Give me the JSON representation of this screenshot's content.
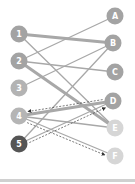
{
  "diagram": {
    "type": "bipartite-graph",
    "left_nodes": [
      {
        "id": "1",
        "label": "1",
        "x": 19,
        "y": 34,
        "color": "#a3a3a3"
      },
      {
        "id": "2",
        "label": "2",
        "x": 19,
        "y": 61,
        "color": "#a3a3a3"
      },
      {
        "id": "3",
        "label": "3",
        "x": 19,
        "y": 88,
        "color": "#b3b3b3"
      },
      {
        "id": "4",
        "label": "4",
        "x": 19,
        "y": 116,
        "color": "#b5b5b5"
      },
      {
        "id": "5",
        "label": "5",
        "x": 19,
        "y": 144,
        "color": "#555555"
      }
    ],
    "right_nodes": [
      {
        "id": "A",
        "label": "A",
        "x": 115,
        "y": 16,
        "color": "#a3a3a3"
      },
      {
        "id": "B",
        "label": "B",
        "x": 113,
        "y": 43,
        "color": "#a3a3a3"
      },
      {
        "id": "C",
        "label": "C",
        "x": 115,
        "y": 72,
        "color": "#a3a3a3"
      },
      {
        "id": "D",
        "label": "D",
        "x": 113,
        "y": 101,
        "color": "#a3a3a3"
      },
      {
        "id": "E",
        "label": "E",
        "x": 115,
        "y": 128,
        "color": "#d6d6d6"
      },
      {
        "id": "F",
        "label": "F",
        "x": 115,
        "y": 156,
        "color": "#d6d6d6"
      }
    ],
    "edges": [
      {
        "from": "1",
        "to": "B",
        "style": "thick"
      },
      {
        "from": "1",
        "to": "E",
        "style": "thin"
      },
      {
        "from": "2",
        "to": "A",
        "style": "thin"
      },
      {
        "from": "2",
        "to": "C",
        "style": "thin"
      },
      {
        "from": "2",
        "to": "E",
        "style": "thick"
      },
      {
        "from": "3",
        "to": "B",
        "style": "thin"
      },
      {
        "from": "4",
        "to": "D",
        "style": "thick"
      },
      {
        "from": "4",
        "to": "E",
        "style": "thin"
      },
      {
        "from": "4",
        "to": "F",
        "style": "thin"
      },
      {
        "from": "5",
        "to": "B",
        "style": "thin"
      },
      {
        "from": "5",
        "to": "D",
        "style": "thin"
      }
    ],
    "dashed_arrows": [
      {
        "from": "D",
        "to": "4"
      },
      {
        "from": "5",
        "to": "D"
      },
      {
        "from": "4",
        "to": "F"
      }
    ],
    "colors": {
      "edge": "#a8a8a8",
      "arrow": "#444444",
      "bottom_bar": "#d0d0d0"
    }
  }
}
